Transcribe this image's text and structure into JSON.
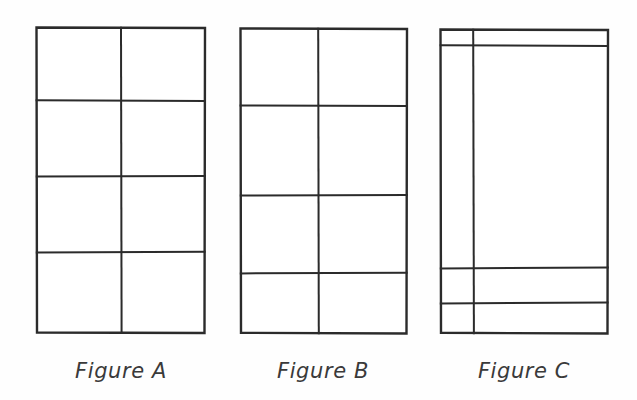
{
  "document": {
    "type": "geometry-figure-set",
    "background_color": "#fefefe",
    "ink_color": "#2b2b2b",
    "figure_count": 3
  },
  "figures": [
    {
      "id": "figure-a",
      "caption": "Figure A",
      "caption_x": 121,
      "caption_y": 378,
      "columns": 2,
      "rows": 4,
      "cell_count": 8,
      "bounds": {
        "x": 36,
        "y": 27,
        "width": 169,
        "height": 306
      },
      "v_lines": [
        121
      ],
      "h_lines": [
        100,
        176,
        252
      ],
      "row_heights": [
        73,
        76,
        76,
        81
      ],
      "col_widths": [
        85,
        84
      ],
      "description": "Rectangle divided into 2 equal columns and 4 nearly equal rows making 8 congruent parts"
    },
    {
      "id": "figure-b",
      "caption": "Figure B",
      "caption_x": 323,
      "caption_y": 378,
      "columns": 2,
      "rows": 4,
      "cell_count": 8,
      "bounds": {
        "x": 240,
        "y": 28,
        "width": 167,
        "height": 305
      },
      "v_lines": [
        318
      ],
      "h_lines": [
        105,
        195,
        273
      ],
      "row_heights": [
        77,
        90,
        78,
        60
      ],
      "col_widths": [
        78,
        89
      ],
      "description": "Rectangle divided into 2 unequal columns and 4 unequal rows making 8 parts of different sizes"
    },
    {
      "id": "figure-c",
      "caption": "Figure C",
      "caption_x": 524,
      "caption_y": 378,
      "columns": 2,
      "rows": 4,
      "cell_count": 8,
      "bounds": {
        "x": 440,
        "y": 29,
        "width": 168,
        "height": 304
      },
      "v_lines": [
        473
      ],
      "h_lines": [
        45,
        268,
        303
      ],
      "row_heights": [
        16,
        223,
        35,
        30
      ],
      "col_widths": [
        33,
        135
      ],
      "description": "Rectangle divided into one narrow and one wide column, with a thin top row, a very tall middle row and two thin bottom rows"
    }
  ],
  "captions": {
    "figure_a_label": "Figure A",
    "figure_b_label": "Figure B",
    "figure_c_label": "Figure C"
  }
}
